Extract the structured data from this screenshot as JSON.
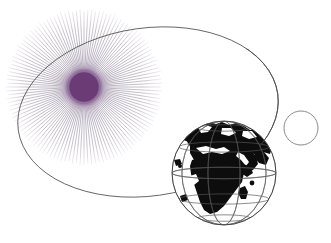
{
  "figure": {
    "width": 331,
    "height": 243,
    "background_color": "#ffffff"
  },
  "colors": {
    "background": "#ffffff",
    "sun_core": "#6b3b76",
    "sun_core_dark": "#5d3068",
    "sun_glow": "#9b7aa8",
    "sun_ray": "#7a6a86",
    "orbit_line": "#4a4a4a",
    "globe_land": "#0d0d0d",
    "globe_ocean": "#ffffff",
    "globe_graticule": "#555555",
    "small_circle_stroke": "#8a8a8a"
  },
  "objects": {
    "sun": {
      "name": "sun",
      "center_x": 84,
      "center_y": 87,
      "disc_radius": 15,
      "glow_radius": 26,
      "ray_count": 124,
      "ray_inner_radius": 16,
      "ray_outer_radius": 76,
      "ray_width": 0.55
    },
    "orbit": {
      "name": "elliptical-orbit",
      "center_x": 148,
      "center_y": 112,
      "semi_major": 131,
      "semi_minor": 84,
      "rotation_deg": -8,
      "stroke_width": 0.8
    },
    "earth": {
      "name": "earth-globe",
      "center_x": 224,
      "center_y": 173,
      "radius": 52,
      "meridian_count": 5,
      "parallel_count": 5,
      "visible_regions": [
        "Africa",
        "Europe",
        "Asia",
        "Arabia",
        "Madagascar",
        "Greenland"
      ]
    },
    "small_circle": {
      "name": "secondary-body-outline",
      "center_x": 301,
      "center_y": 128,
      "radius": 17,
      "stroke_width": 1,
      "fill": "none"
    }
  }
}
